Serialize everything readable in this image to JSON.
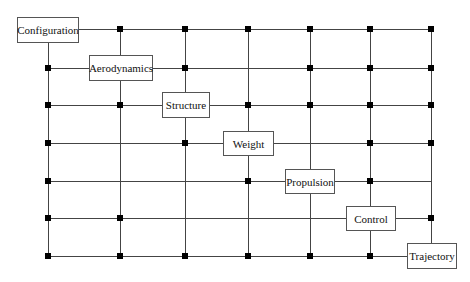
{
  "diagram": {
    "type": "N2 / design structure matrix",
    "nodes": [
      {
        "label": "Configuration",
        "x": 17,
        "y": 17,
        "w": 62,
        "h": 26
      },
      {
        "label": "Aerodynamics",
        "x": 89,
        "y": 55,
        "w": 64,
        "h": 26
      },
      {
        "label": "Structure",
        "x": 162,
        "y": 92,
        "w": 48,
        "h": 26
      },
      {
        "label": "Weight",
        "x": 223,
        "y": 131,
        "w": 51,
        "h": 25
      },
      {
        "label": "Propulsion",
        "x": 285,
        "y": 169,
        "w": 50,
        "h": 25
      },
      {
        "label": "Control",
        "x": 346,
        "y": 206,
        "w": 50,
        "h": 25
      },
      {
        "label": "Trajectory",
        "x": 407,
        "y": 243,
        "w": 50,
        "h": 26
      }
    ],
    "column_x": [
      48,
      120,
      185,
      248,
      310,
      370,
      431
    ],
    "row_y": [
      29,
      68,
      105,
      143,
      181,
      218,
      256
    ],
    "coupling_matrix": [
      [
        0,
        1,
        1,
        1,
        1,
        1,
        1
      ],
      [
        1,
        0,
        1,
        0,
        1,
        1,
        1
      ],
      [
        1,
        1,
        0,
        1,
        1,
        1,
        1
      ],
      [
        1,
        0,
        1,
        0,
        0,
        1,
        1
      ],
      [
        1,
        0,
        0,
        1,
        0,
        1,
        0
      ],
      [
        1,
        1,
        0,
        0,
        0,
        0,
        1
      ],
      [
        1,
        1,
        1,
        1,
        1,
        1,
        0
      ]
    ],
    "colors": {
      "line": "#444444",
      "dot": "#000000",
      "box_border": "#555555",
      "box_fill": "#ffffff"
    }
  }
}
